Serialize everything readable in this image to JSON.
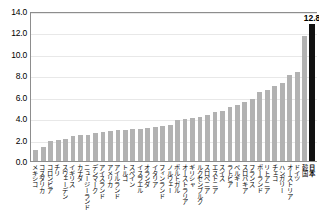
{
  "chart_data": {
    "type": "bar",
    "title": "",
    "xlabel": "",
    "ylabel": "",
    "ylim": [
      0.0,
      14.0
    ],
    "ytick_labels": [
      "14.0",
      "12.0",
      "10.0",
      "8.0",
      "6.0",
      "4.0",
      "2.0",
      "0.0"
    ],
    "ytick_values": [
      14.0,
      12.0,
      10.0,
      8.0,
      6.0,
      4.0,
      2.0,
      0.0
    ],
    "grid": true,
    "legend": "none",
    "highlight_category": "日本",
    "highlight_color": "#111111",
    "bar_color": "#b2b2b2",
    "categories": [
      "メキシコ",
      "コスタリカ",
      "コロンビア",
      "チリ",
      "スウェーデン",
      "イギリス",
      "カナダ",
      "ニュージーランド",
      "デンマーク",
      "アイスランド",
      "アメリカ",
      "アイルランド",
      "トルコ",
      "スペイン",
      "イスラエル",
      "オランダ",
      "イタリア",
      "フィンランド",
      "ノルウェー",
      "ポルトガル",
      "オーストラリア",
      "ギリシャ",
      "ルクセンブルク",
      "スロベニア",
      "エストニア",
      "スイス",
      "ラトビア",
      "ベルギー",
      "スロバキア",
      "フランス",
      "ポーランド",
      "リトアニア",
      "チェコ",
      "ハンガリー",
      "オーストリア",
      "ドイツ",
      "韓国",
      "日本"
    ],
    "values": [
      1.0,
      1.3,
      1.9,
      2.0,
      2.1,
      2.3,
      2.4,
      2.4,
      2.6,
      2.7,
      2.8,
      2.9,
      2.9,
      3.0,
      3.0,
      3.1,
      3.2,
      3.3,
      3.4,
      3.8,
      3.9,
      4.0,
      4.1,
      4.3,
      4.6,
      4.7,
      5.0,
      5.2,
      5.5,
      5.8,
      6.4,
      6.6,
      7.0,
      7.3,
      8.0,
      8.3,
      11.7,
      12.8
    ],
    "data_labels": {
      "日本": "12.8"
    }
  }
}
